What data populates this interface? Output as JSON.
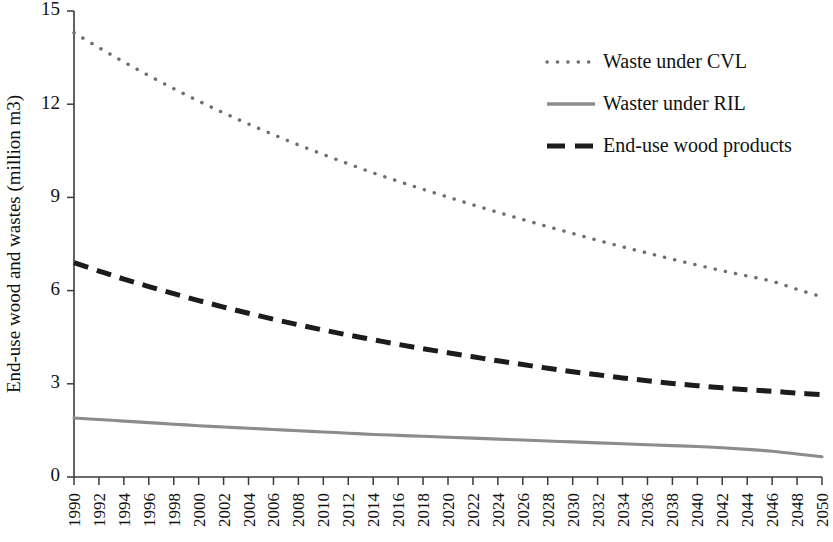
{
  "chart_data": {
    "type": "line",
    "title": "",
    "subtitle": "",
    "xlabel": "",
    "ylabel": "End-use wood and wastes (million m3)",
    "xlim": [
      1990,
      2050
    ],
    "ylim": [
      0,
      15
    ],
    "yticks": [
      0,
      3,
      6,
      9,
      12,
      15
    ],
    "ytick_labels": [
      "0",
      "3",
      "6",
      "9",
      "12",
      "15"
    ],
    "grid": false,
    "legend_position": "top-right",
    "x": [
      1990,
      1992,
      1994,
      1996,
      1998,
      2000,
      2002,
      2004,
      2006,
      2008,
      2010,
      2012,
      2014,
      2016,
      2018,
      2020,
      2022,
      2024,
      2026,
      2028,
      2030,
      2032,
      2034,
      2036,
      2038,
      2040,
      2042,
      2044,
      2046,
      2048,
      2050
    ],
    "xtick_labels": [
      "1990",
      "1992",
      "1994",
      "1996",
      "1998",
      "2000",
      "2002",
      "2004",
      "2006",
      "2008",
      "2010",
      "2012",
      "2014",
      "2016",
      "2018",
      "2020",
      "2022",
      "2024",
      "2026",
      "2028",
      "2030",
      "2032",
      "2034",
      "2036",
      "2038",
      "2040",
      "2042",
      "2044",
      "2046",
      "2048",
      "2050"
    ],
    "series": [
      {
        "name": "Waste under CVL",
        "style": "dotted",
        "color": "#6e6e6e",
        "values": [
          14.3,
          13.82,
          13.36,
          12.92,
          12.5,
          12.1,
          11.72,
          11.36,
          11.02,
          10.69,
          10.38,
          10.08,
          9.79,
          9.52,
          9.26,
          9.01,
          8.76,
          8.52,
          8.29,
          8.06,
          7.84,
          7.62,
          7.41,
          7.21,
          7.01,
          6.82,
          6.64,
          6.47,
          6.3,
          6.04,
          5.8
        ]
      },
      {
        "name": "Waster under RIL",
        "style": "solid",
        "color": "#8c8c8c",
        "values": [
          1.9,
          1.85,
          1.8,
          1.75,
          1.7,
          1.65,
          1.61,
          1.57,
          1.53,
          1.49,
          1.45,
          1.41,
          1.37,
          1.34,
          1.31,
          1.28,
          1.25,
          1.22,
          1.19,
          1.16,
          1.13,
          1.1,
          1.07,
          1.04,
          1.01,
          0.98,
          0.94,
          0.89,
          0.83,
          0.74,
          0.65
        ]
      },
      {
        "name": "End-use wood products",
        "style": "dashed",
        "color": "#1c1c1c",
        "values": [
          6.9,
          6.63,
          6.37,
          6.13,
          5.9,
          5.68,
          5.47,
          5.27,
          5.08,
          4.9,
          4.73,
          4.57,
          4.42,
          4.27,
          4.13,
          4.0,
          3.87,
          3.74,
          3.62,
          3.5,
          3.39,
          3.29,
          3.19,
          3.1,
          3.01,
          2.94,
          2.87,
          2.81,
          2.76,
          2.7,
          2.65
        ]
      }
    ]
  },
  "legend": {
    "items": [
      {
        "label": "Waste under CVL"
      },
      {
        "label": "Waster under RIL"
      },
      {
        "label": "End-use wood products"
      }
    ]
  }
}
